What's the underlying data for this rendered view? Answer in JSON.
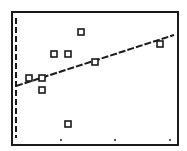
{
  "screen": {
    "background": "#ffffff",
    "ink": "#1a1a1a",
    "frame": {
      "x1": 12,
      "y1": 12,
      "x2": 178,
      "y2": 145
    }
  },
  "chart_data": {
    "type": "scatter",
    "title": "",
    "xlabel": "",
    "ylabel": "",
    "grid": false,
    "legend": "none",
    "points_px": [
      {
        "x": 29,
        "y": 78
      },
      {
        "x": 42,
        "y": 78
      },
      {
        "x": 42,
        "y": 90
      },
      {
        "x": 54,
        "y": 54
      },
      {
        "x": 68,
        "y": 54
      },
      {
        "x": 81,
        "y": 32
      },
      {
        "x": 95,
        "y": 62
      },
      {
        "x": 68,
        "y": 124
      },
      {
        "x": 160,
        "y": 44
      }
    ],
    "regression_line_px": {
      "x1": 16,
      "y1": 86,
      "x2": 174,
      "y2": 35
    },
    "y_axis_px": {
      "x": 16,
      "y1": 18,
      "y2": 138,
      "style": "dashed"
    },
    "x_tick_dots_px": [
      {
        "x": 61,
        "y": 140
      },
      {
        "x": 115,
        "y": 140
      },
      {
        "x": 170,
        "y": 140
      }
    ]
  }
}
